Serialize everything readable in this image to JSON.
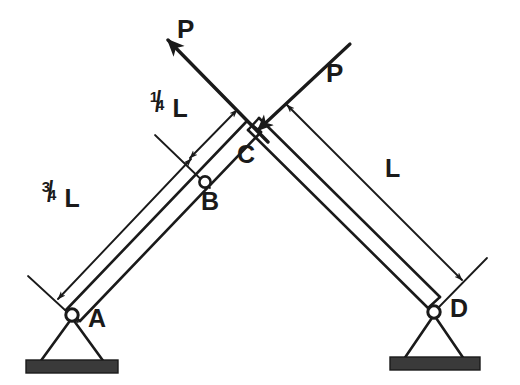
{
  "figure": {
    "background_color": "#ffffff",
    "ink_color": "#1a1a1a"
  },
  "joints": [
    {
      "id": "A",
      "label": "A",
      "type": "pin-support",
      "x": 72,
      "y": 315
    },
    {
      "id": "B",
      "label": "B",
      "type": "pin-connection",
      "x": 205,
      "y": 182
    },
    {
      "id": "C",
      "label": "C",
      "type": "crossing-point",
      "x": 253,
      "y": 126
    },
    {
      "id": "D",
      "label": "D",
      "type": "pin-support",
      "x": 434,
      "y": 312
    }
  ],
  "members": [
    {
      "id": "AC",
      "label": "left-member",
      "from": "A",
      "to": "C"
    },
    {
      "id": "CD",
      "label": "right-member",
      "from": "C",
      "to": "D"
    }
  ],
  "forces": [
    {
      "id": "P-left",
      "label": "P",
      "direction": "up-left",
      "label_x": 177,
      "label_y": 18
    },
    {
      "id": "P-right",
      "label": "P",
      "direction": "down-left",
      "label_x": 328,
      "label_y": 62
    }
  ],
  "dimensions": [
    {
      "id": "three-quarter-L",
      "label": "¾ L",
      "numerator": "3",
      "denominator": "4",
      "unit": "L",
      "spans": "A to B",
      "label_x": 44,
      "label_y": 183
    },
    {
      "id": "quarter-L",
      "label": "¼ L",
      "numerator": "1",
      "denominator": "4",
      "unit": "L",
      "spans": "B to C",
      "label_x": 152,
      "label_y": 93
    },
    {
      "id": "full-L",
      "label": "L",
      "numerator": "",
      "denominator": "",
      "unit": "L",
      "spans": "C to D",
      "label_x": 385,
      "label_y": 157
    }
  ],
  "supports": [
    {
      "id": "support-A",
      "label": "A",
      "kind": "pinned",
      "pin_x": 72,
      "pin_y": 315
    },
    {
      "id": "support-D",
      "label": "D",
      "kind": "pinned",
      "pin_x": 434,
      "pin_y": 312
    }
  ],
  "point_labels": {
    "A": {
      "text": "A",
      "x": 88,
      "y": 308
    },
    "B": {
      "text": "B",
      "x": 202,
      "y": 190
    },
    "C": {
      "text": "C",
      "x": 238,
      "y": 144
    },
    "D": {
      "text": "D",
      "x": 450,
      "y": 298
    }
  }
}
